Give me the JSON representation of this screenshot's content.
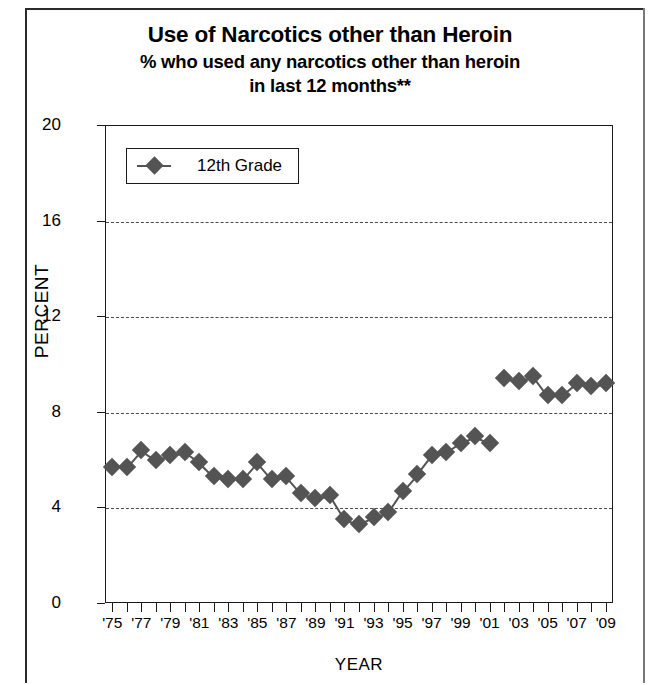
{
  "title": {
    "line1": "Use of Narcotics other than Heroin",
    "line2": "% who used any narcotics other than heroin",
    "line3": "in last 12 months**"
  },
  "legend": {
    "items": [
      {
        "label": "12th Grade",
        "marker": "diamond-marker",
        "color": "#545454"
      }
    ]
  },
  "axes": {
    "y_title": "PERCENT",
    "x_title": "YEAR",
    "y_ticks": [
      "0",
      "4",
      "8",
      "12",
      "16",
      "20"
    ],
    "x_tick_labels": [
      "'75",
      "'77",
      "'79",
      "'81",
      "'83",
      "'85",
      "'87",
      "'89",
      "'91",
      "'93",
      "'95",
      "'97",
      "'99",
      "'01",
      "'03",
      "'05",
      "'07",
      "'09"
    ]
  },
  "chart_data": {
    "type": "line",
    "title": "Use of Narcotics other than Heroin",
    "subtitle": "% who used any narcotics other than heroin in last 12 months**",
    "xlabel": "YEAR",
    "ylabel": "PERCENT",
    "xlim": [
      1974.5,
      2009.5
    ],
    "ylim": [
      0,
      20
    ],
    "ytick_values": [
      0,
      4,
      8,
      12,
      16,
      20
    ],
    "gridlines_at": [
      4,
      8,
      12,
      16
    ],
    "grid": true,
    "grid_style": "dash-dot",
    "legend_position": "top-left-inside",
    "marker": "diamond",
    "series": [
      {
        "name": "12th Grade",
        "color": "#545454",
        "x": [
          1975,
          1976,
          1977,
          1978,
          1979,
          1980,
          1981,
          1982,
          1983,
          1984,
          1985,
          1986,
          1987,
          1988,
          1989,
          1990,
          1991,
          1992,
          1993,
          1994,
          1995,
          1996,
          1997,
          1998,
          1999,
          2000,
          2001,
          2002,
          2003,
          2004,
          2005,
          2006,
          2007,
          2008,
          2009
        ],
        "values": [
          5.7,
          5.7,
          6.4,
          6.0,
          6.2,
          6.3,
          5.9,
          5.3,
          5.2,
          5.2,
          5.9,
          5.2,
          5.3,
          4.6,
          4.4,
          4.5,
          3.5,
          3.3,
          3.6,
          3.8,
          4.7,
          5.4,
          6.2,
          6.3,
          6.7,
          7.0,
          6.7,
          9.4,
          9.3,
          9.5,
          8.7,
          8.7,
          9.2,
          9.1,
          9.2
        ],
        "break_after_x": 2001,
        "break_note": "question wording change between 2001 and 2002"
      }
    ]
  }
}
